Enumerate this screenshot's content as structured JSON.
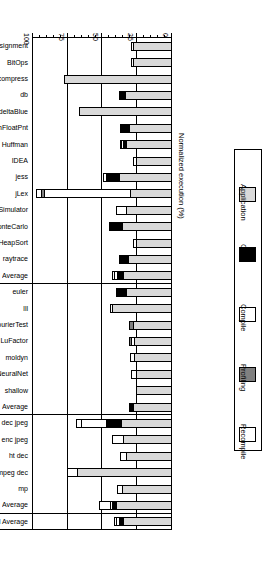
{
  "chart_data": {
    "type": "bar",
    "orientation": "horizontal-stacked",
    "title": "",
    "xlabel": "Normalized execution (%)",
    "ylabel": "",
    "xlim": [
      0,
      100
    ],
    "xticks": [
      0,
      25,
      50,
      75,
      100
    ],
    "xticklabels": [
      "0",
      "25",
      "50",
      "75",
      "100"
    ],
    "grid": true,
    "legend_position": "left",
    "series": [
      {
        "name": "Application",
        "color": "#d9d9d9"
      },
      {
        "name": "GC",
        "color": "#000000"
      },
      {
        "name": "Compile",
        "color": "#ffffff"
      },
      {
        "name": "Profiling",
        "color": "#808080"
      },
      {
        "name": "Recompile",
        "color": "#ffffff"
      }
    ],
    "groups": [
      {
        "name": "Integer",
        "categories": [
          "Assignment",
          "BitOps",
          "compress",
          "db",
          "deltaBlue",
          "EmFloatPnt",
          "Huffman",
          "IDEA",
          "jess",
          "jLex",
          "MipsSimulator",
          "monteCarlo",
          "NumHeapSort",
          "raytrace",
          "Average"
        ]
      },
      {
        "name": "Floating Point",
        "categories": [
          "euler",
          "lll",
          "FourierTest",
          "LuFactor",
          "moldyn",
          "NeuralNet",
          "shallow",
          "Average"
        ]
      },
      {
        "name": "Multimedia",
        "categories": [
          "dec jpeg",
          "enc jpeg",
          "ht dec",
          "mpeg dec",
          "mp",
          "Average"
        ]
      },
      {
        "name": "",
        "categories": [
          "All Average"
        ]
      }
    ],
    "bars": [
      {
        "group": "Integer",
        "label": "Assignment",
        "segments": [
          {
            "series": "Application",
            "value": 28.0
          },
          {
            "series": "GC",
            "value": 0.0
          },
          {
            "series": "Compile",
            "value": 2.5
          },
          {
            "series": "Profiling",
            "value": 0.0
          },
          {
            "series": "Recompile",
            "value": 0.0
          }
        ],
        "total": 30.5
      },
      {
        "group": "Integer",
        "label": "BitOps",
        "segments": [
          {
            "series": "Application",
            "value": 28.0
          },
          {
            "series": "GC",
            "value": 0.0
          },
          {
            "series": "Compile",
            "value": 2.5
          },
          {
            "series": "Profiling",
            "value": 0.0
          },
          {
            "series": "Recompile",
            "value": 0.0
          }
        ],
        "total": 30.5
      },
      {
        "group": "Integer",
        "label": "compress",
        "segments": [
          {
            "series": "Application",
            "value": 78.0
          },
          {
            "series": "GC",
            "value": 0.0
          },
          {
            "series": "Compile",
            "value": 0.0
          },
          {
            "series": "Profiling",
            "value": 0.0
          },
          {
            "series": "Recompile",
            "value": 0.0
          }
        ],
        "total": 78.0
      },
      {
        "group": "Integer",
        "label": "db",
        "segments": [
          {
            "series": "Application",
            "value": 34.0
          },
          {
            "series": "GC",
            "value": 5.0
          },
          {
            "series": "Compile",
            "value": 0.0
          },
          {
            "series": "Profiling",
            "value": 0.0
          },
          {
            "series": "Recompile",
            "value": 0.0
          }
        ],
        "total": 39.0
      },
      {
        "group": "Integer",
        "label": "deltaBlue",
        "segments": [
          {
            "series": "Application",
            "value": 67.0
          },
          {
            "series": "GC",
            "value": 0.0
          },
          {
            "series": "Compile",
            "value": 0.0
          },
          {
            "series": "Profiling",
            "value": 0.0
          },
          {
            "series": "Recompile",
            "value": 0.0
          }
        ],
        "total": 67.0
      },
      {
        "group": "Integer",
        "label": "EmFloatPnt",
        "segments": [
          {
            "series": "Application",
            "value": 31.0
          },
          {
            "series": "GC",
            "value": 7.0
          },
          {
            "series": "Compile",
            "value": 0.0
          },
          {
            "series": "Profiling",
            "value": 0.0
          },
          {
            "series": "Recompile",
            "value": 0.0
          }
        ],
        "total": 38.0
      },
      {
        "group": "Integer",
        "label": "Huffman",
        "segments": [
          {
            "series": "Application",
            "value": 33.0
          },
          {
            "series": "GC",
            "value": 3.0
          },
          {
            "series": "Compile",
            "value": 2.0
          },
          {
            "series": "Profiling",
            "value": 0.0
          },
          {
            "series": "Recompile",
            "value": 1.5
          }
        ],
        "total": 39.5
      },
      {
        "group": "Integer",
        "label": "IDEA",
        "segments": [
          {
            "series": "Application",
            "value": 26.0
          },
          {
            "series": "GC",
            "value": 0.0
          },
          {
            "series": "Compile",
            "value": 3.0
          },
          {
            "series": "Profiling",
            "value": 0.0
          },
          {
            "series": "Recompile",
            "value": 0.0
          }
        ],
        "total": 29.0
      },
      {
        "group": "Integer",
        "label": "jess",
        "segments": [
          {
            "series": "Application",
            "value": 38.0
          },
          {
            "series": "GC",
            "value": 10.0
          },
          {
            "series": "Compile",
            "value": 3.0
          },
          {
            "series": "Profiling",
            "value": 0.0
          },
          {
            "series": "Recompile",
            "value": 0.0
          }
        ],
        "total": 51.0
      },
      {
        "group": "Integer",
        "label": "jLex",
        "segments": [
          {
            "series": "Application",
            "value": 30.0
          },
          {
            "series": "GC",
            "value": 0.0
          },
          {
            "series": "Compile",
            "value": 63.0
          },
          {
            "series": "Profiling",
            "value": 3.0
          },
          {
            "series": "Recompile",
            "value": 4.0
          }
        ],
        "total": 100.0
      },
      {
        "group": "Integer",
        "label": "MipsSimulator",
        "segments": [
          {
            "series": "Application",
            "value": 33.0
          },
          {
            "series": "GC",
            "value": 0.0
          },
          {
            "series": "Compile",
            "value": 8.0
          },
          {
            "series": "Profiling",
            "value": 0.0
          },
          {
            "series": "Recompile",
            "value": 0.0
          }
        ],
        "total": 41.0
      },
      {
        "group": "Integer",
        "label": "monteCarlo",
        "segments": [
          {
            "series": "Application",
            "value": 36.0
          },
          {
            "series": "GC",
            "value": 10.0
          },
          {
            "series": "Compile",
            "value": 0.0
          },
          {
            "series": "Profiling",
            "value": 0.0
          },
          {
            "series": "Recompile",
            "value": 0.0
          }
        ],
        "total": 46.0
      },
      {
        "group": "Integer",
        "label": "NumHeapSort",
        "segments": [
          {
            "series": "Application",
            "value": 26.0
          },
          {
            "series": "GC",
            "value": 0.0
          },
          {
            "series": "Compile",
            "value": 3.0
          },
          {
            "series": "Profiling",
            "value": 0.0
          },
          {
            "series": "Recompile",
            "value": 0.0
          }
        ],
        "total": 29.0
      },
      {
        "group": "Integer",
        "label": "raytrace",
        "segments": [
          {
            "series": "Application",
            "value": 32.0
          },
          {
            "series": "GC",
            "value": 7.0
          },
          {
            "series": "Compile",
            "value": 0.0
          },
          {
            "series": "Profiling",
            "value": 0.0
          },
          {
            "series": "Recompile",
            "value": 0.0
          }
        ],
        "total": 39.0
      },
      {
        "group": "Integer",
        "label": "Average",
        "segments": [
          {
            "series": "Application",
            "value": 35.0
          },
          {
            "series": "GC",
            "value": 5.0
          },
          {
            "series": "Compile",
            "value": 3.0
          },
          {
            "series": "Profiling",
            "value": 0.0
          },
          {
            "series": "Recompile",
            "value": 2.0
          }
        ],
        "total": 45.0
      },
      {
        "group": "Floating Point",
        "label": "euler",
        "segments": [
          {
            "series": "Application",
            "value": 33.0
          },
          {
            "series": "GC",
            "value": 8.0
          },
          {
            "series": "Compile",
            "value": 0.0
          },
          {
            "series": "Profiling",
            "value": 0.0
          },
          {
            "series": "Recompile",
            "value": 0.0
          }
        ],
        "total": 41.0
      },
      {
        "group": "Floating Point",
        "label": "lll",
        "segments": [
          {
            "series": "Application",
            "value": 43.0
          },
          {
            "series": "GC",
            "value": 0.0
          },
          {
            "series": "Compile",
            "value": 2.0
          },
          {
            "series": "Profiling",
            "value": 0.0
          },
          {
            "series": "Recompile",
            "value": 0.0
          }
        ],
        "total": 45.0
      },
      {
        "group": "Floating Point",
        "label": "FourierTest",
        "segments": [
          {
            "series": "Application",
            "value": 28.0
          },
          {
            "series": "GC",
            "value": 0.0
          },
          {
            "series": "Compile",
            "value": 0.0
          },
          {
            "series": "Profiling",
            "value": 4.0
          },
          {
            "series": "Recompile",
            "value": 0.0
          }
        ],
        "total": 32.0
      },
      {
        "group": "Floating Point",
        "label": "LuFactor",
        "segments": [
          {
            "series": "Application",
            "value": 27.0
          },
          {
            "series": "GC",
            "value": 0.0
          },
          {
            "series": "Compile",
            "value": 3.0
          },
          {
            "series": "Profiling",
            "value": 2.5
          },
          {
            "series": "Recompile",
            "value": 0.0
          }
        ],
        "total": 32.5
      },
      {
        "group": "Floating Point",
        "label": "moldyn",
        "segments": [
          {
            "series": "Application",
            "value": 27.0
          },
          {
            "series": "GC",
            "value": 0.0
          },
          {
            "series": "Compile",
            "value": 4.0
          },
          {
            "series": "Profiling",
            "value": 0.0
          },
          {
            "series": "Recompile",
            "value": 0.0
          }
        ],
        "total": 31.0
      },
      {
        "group": "Floating Point",
        "label": "NeuralNet",
        "segments": [
          {
            "series": "Application",
            "value": 26.0
          },
          {
            "series": "GC",
            "value": 0.0
          },
          {
            "series": "Compile",
            "value": 4.5
          },
          {
            "series": "Profiling",
            "value": 0.0
          },
          {
            "series": "Recompile",
            "value": 0.0
          }
        ],
        "total": 30.5
      },
      {
        "group": "Floating Point",
        "label": "shallow",
        "segments": [
          {
            "series": "Application",
            "value": 26.0
          },
          {
            "series": "GC",
            "value": 0.0
          },
          {
            "series": "Compile",
            "value": 0.0
          },
          {
            "series": "Profiling",
            "value": 0.0
          },
          {
            "series": "Recompile",
            "value": 0.0
          }
        ],
        "total": 26.0
      },
      {
        "group": "Floating Point",
        "label": "Average",
        "segments": [
          {
            "series": "Application",
            "value": 28.0
          },
          {
            "series": "GC",
            "value": 2.0
          },
          {
            "series": "Compile",
            "value": 2.0
          },
          {
            "series": "Profiling",
            "value": 1.0
          },
          {
            "series": "Recompile",
            "value": 0.0
          }
        ],
        "total": 33.0
      },
      {
        "group": "Multimedia",
        "label": "dec jpeg",
        "segments": [
          {
            "series": "Application",
            "value": 37.0
          },
          {
            "series": "GC",
            "value": 11.0
          },
          {
            "series": "Compile",
            "value": 19.0
          },
          {
            "series": "Profiling",
            "value": 0.0
          },
          {
            "series": "Recompile",
            "value": 4.0
          }
        ],
        "total": 71.0
      },
      {
        "group": "Multimedia",
        "label": "enc jpeg",
        "segments": [
          {
            "series": "Application",
            "value": 35.0
          },
          {
            "series": "GC",
            "value": 0.0
          },
          {
            "series": "Compile",
            "value": 9.0
          },
          {
            "series": "Profiling",
            "value": 0.0
          },
          {
            "series": "Recompile",
            "value": 0.0
          }
        ],
        "total": 44.0
      },
      {
        "group": "Multimedia",
        "label": "ht dec",
        "segments": [
          {
            "series": "Application",
            "value": 33.0
          },
          {
            "series": "GC",
            "value": 0.0
          },
          {
            "series": "Compile",
            "value": 5.0
          },
          {
            "series": "Profiling",
            "value": 0.0
          },
          {
            "series": "Recompile",
            "value": 0.0
          }
        ],
        "total": 38.0
      },
      {
        "group": "Multimedia",
        "label": "mpeg dec",
        "segments": [
          {
            "series": "Application",
            "value": 68.0
          },
          {
            "series": "GC",
            "value": 0.0
          },
          {
            "series": "Compile",
            "value": 8.0
          },
          {
            "series": "Profiling",
            "value": 0.0
          },
          {
            "series": "Recompile",
            "value": 0.0
          }
        ],
        "total": 76.0
      },
      {
        "group": "Multimedia",
        "label": "mp",
        "segments": [
          {
            "series": "Application",
            "value": 36.0
          },
          {
            "series": "GC",
            "value": 0.0
          },
          {
            "series": "Compile",
            "value": 4.0
          },
          {
            "series": "Profiling",
            "value": 0.0
          },
          {
            "series": "Recompile",
            "value": 0.0
          }
        ],
        "total": 40.0
      },
      {
        "group": "Multimedia",
        "label": "Average",
        "segments": [
          {
            "series": "Application",
            "value": 40.0
          },
          {
            "series": "GC",
            "value": 4.0
          },
          {
            "series": "Compile",
            "value": 2.0
          },
          {
            "series": "Profiling",
            "value": 0.0
          },
          {
            "series": "Recompile",
            "value": 9.0
          }
        ],
        "total": 55.0
      },
      {
        "group": "",
        "label": "All Average",
        "segments": [
          {
            "series": "Application",
            "value": 35.0
          },
          {
            "series": "GC",
            "value": 4.0
          },
          {
            "series": "Compile",
            "value": 2.5
          },
          {
            "series": "Profiling",
            "value": 0.0
          },
          {
            "series": "Recompile",
            "value": 2.5
          }
        ],
        "total": 44.0
      }
    ]
  },
  "legend": {
    "items": [
      {
        "label": "Recompile",
        "color": "#ffffff"
      },
      {
        "label": "Profiling",
        "color": "#808080"
      },
      {
        "label": "Compile",
        "color": "#ffffff"
      },
      {
        "label": "GC",
        "color": "#000000"
      },
      {
        "label": "Application",
        "color": "#d9d9d9"
      }
    ]
  },
  "axis": {
    "x_title": "Normalized execution (%)",
    "x_ticklabels": [
      "0",
      "25",
      "50",
      "75",
      "100"
    ]
  },
  "group_titles": [
    "Integer",
    "Floating Point",
    "Multimedia"
  ]
}
